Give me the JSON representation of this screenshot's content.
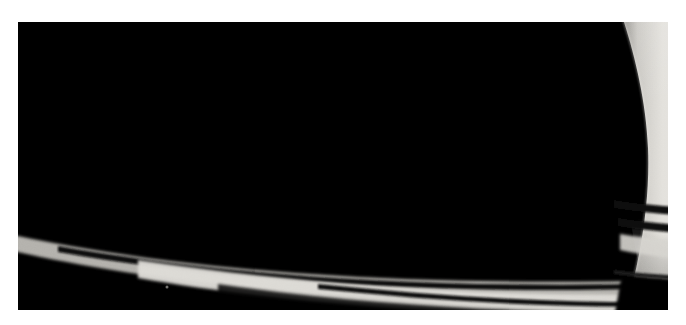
{
  "image": {
    "subject": "saturn-rings",
    "description": "Grayscale spacecraft view of Saturn's rings seen at a low angle, with the planet's bright limb at the right edge",
    "palette": {
      "background": "#ffffff",
      "space": "#000000",
      "planet_limb_bright": "#e8e6e2",
      "planet_limb_mid": "#d2d0cb",
      "planet_limb_shadow": "#a9a7a2",
      "b_ring_bright": "#d9d7d2",
      "a_ring": "#b2b0ab",
      "c_ring_dark": "#2a2a2a",
      "cassini_division": "#161616",
      "encke_gap": "#0d0d0d",
      "f_ring_faint": "#565450"
    },
    "frame": {
      "left": 18,
      "top": 22,
      "width": 650,
      "height": 288
    }
  },
  "features": {
    "planet": {
      "name": "saturn-limb",
      "edge_x": 620,
      "note": "bright cloud-top limb occupying right edge, curving outward near vertical center"
    },
    "rings": [
      {
        "id": "f-ring",
        "label": "F ring",
        "tone": "#4a4845",
        "width": 1.2,
        "rx": 600,
        "ry": 232
      },
      {
        "id": "a-ring-outer-edge",
        "label": "A ring outer edge",
        "tone": "#9d9b96",
        "width": 11,
        "rx": 566,
        "ry": 214
      },
      {
        "id": "encke-gap",
        "label": "Encke Gap",
        "tone": "#0a0a0a",
        "width": 5,
        "rx": 540,
        "ry": 203
      },
      {
        "id": "a-ring-inner",
        "label": "A ring",
        "tone": "#b4b2ad",
        "width": 26,
        "rx": 517,
        "ry": 192
      },
      {
        "id": "cassini-division",
        "label": "Cassini Division",
        "tone": "#141414",
        "width": 17,
        "rx": 487,
        "ry": 178
      },
      {
        "id": "b-ring-outer",
        "label": "B ring (outer)",
        "tone": "#dbd9d4",
        "width": 34,
        "rx": 452,
        "ry": 164
      },
      {
        "id": "b-ring-mid",
        "label": "B ring (middle)",
        "tone": "#cbc9c4",
        "width": 32,
        "rx": 411,
        "ry": 147
      },
      {
        "id": "b-ring-bright",
        "label": "B ring (bright)",
        "tone": "#e0ded9",
        "width": 28,
        "rx": 375,
        "ry": 132
      },
      {
        "id": "b-ring-inner",
        "label": "B ring (inner)",
        "tone": "#bdbbb6",
        "width": 26,
        "rx": 342,
        "ry": 118
      },
      {
        "id": "b-ring-edge",
        "label": "B ring inner edge",
        "tone": "#7e7c78",
        "width": 14,
        "rx": 316,
        "ry": 107
      },
      {
        "id": "c-ring-outer",
        "label": "C ring (outer)",
        "tone": "#3d3c3a",
        "width": 16,
        "rx": 296,
        "ry": 99
      },
      {
        "id": "c-ringlet-1",
        "label": "C ringlet",
        "tone": "#6e6c68",
        "width": 3,
        "rx": 283,
        "ry": 93
      },
      {
        "id": "c-ring-mid",
        "label": "C ring (middle)",
        "tone": "#2e2d2c",
        "width": 14,
        "rx": 272,
        "ry": 89
      },
      {
        "id": "c-ringlet-2",
        "label": "C ringlet",
        "tone": "#787672",
        "width": 3,
        "rx": 258,
        "ry": 83
      },
      {
        "id": "c-ring-inner",
        "label": "C ring (inner)",
        "tone": "#262525",
        "width": 22,
        "rx": 243,
        "ry": 77
      },
      {
        "id": "c-ringlet-3",
        "label": "C ringlet",
        "tone": "#6a6865",
        "width": 3,
        "rx": 222,
        "ry": 69
      },
      {
        "id": "d-ring",
        "label": "D ring / inner gap",
        "tone": "#151515",
        "width": 26,
        "rx": 203,
        "ry": 61
      }
    ]
  }
}
